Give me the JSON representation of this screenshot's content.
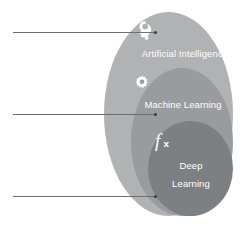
{
  "diagram": {
    "type": "nested-venn",
    "title": "",
    "rings": [
      {
        "id": "artificial-intelligence",
        "label": "Artificial Intelligence",
        "icon": "head-brain-icon",
        "color": "#b0b2b4",
        "level": 1
      },
      {
        "id": "machine-learning",
        "label": "Machine Learning",
        "icon": "gear-icon",
        "color": "#999c9e",
        "level": 2
      },
      {
        "id": "deep-learning",
        "label_line1": "Deep",
        "label_line2": "Learning",
        "icon": "function-fx-icon",
        "color": "#7d8082",
        "level": 3
      }
    ],
    "leader_lines": [
      {
        "id": "leader-ai",
        "points_to": "artificial-intelligence",
        "annotation": ""
      },
      {
        "id": "leader-ml",
        "points_to": "machine-learning",
        "annotation": ""
      },
      {
        "id": "leader-dl",
        "points_to": "deep-learning",
        "annotation": ""
      }
    ],
    "colors": {
      "background": "#ffffff",
      "label_text": "#ffffff",
      "leader_line": "#6c6e70",
      "leader_dot": "#3b3d3f"
    }
  }
}
